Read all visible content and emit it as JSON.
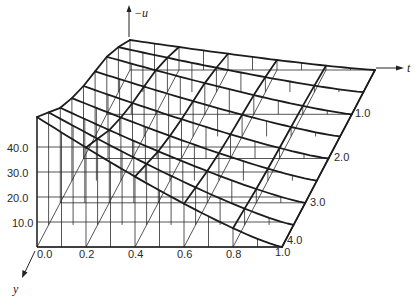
{
  "chart_data": {
    "type": "surface-3d",
    "title": "",
    "axes": {
      "x": {
        "label": "",
        "ticks": [
          "0.0",
          "0.2",
          "0.4",
          "0.6",
          "0.8",
          "1.0"
        ],
        "range": [
          0,
          1
        ]
      },
      "t": {
        "label": "t",
        "ticks": [
          "1.0",
          "2.0",
          "3.0",
          "4.0"
        ],
        "range": [
          0,
          4
        ]
      },
      "u": {
        "label": "−u",
        "ticks": [
          "10.0",
          "20.0",
          "30.0",
          "40.0"
        ],
        "range": [
          0,
          55
        ]
      },
      "y": {
        "label": "y"
      }
    },
    "x": [
      0.0,
      0.2,
      0.4,
      0.6,
      0.8,
      1.0
    ],
    "t": [
      0.0,
      0.5,
      1.0,
      1.5,
      2.0,
      2.5,
      3.0,
      3.5,
      4.0
    ],
    "u_at_x0": [
      12,
      18,
      23,
      26,
      29,
      33,
      38,
      45,
      52
    ],
    "u_profile_exponent": 1.2,
    "note": "Surface −u(x,t) ≈ u_at_x0(t) · (1 − x)^1.2, estimated from wireframe",
    "grid": true,
    "legend": null
  },
  "labels": {
    "u_axis": "−u",
    "t_axis": "t",
    "y_axis": "y",
    "u_ticks": [
      "40.0",
      "30.0",
      "20.0",
      "10.0"
    ],
    "x_ticks": [
      "0.0",
      "0.2",
      "0.4",
      "0.6",
      "0.8",
      "1.0"
    ],
    "t_ticks": [
      "1.0",
      "2.0",
      "3.0",
      "4.0"
    ]
  }
}
